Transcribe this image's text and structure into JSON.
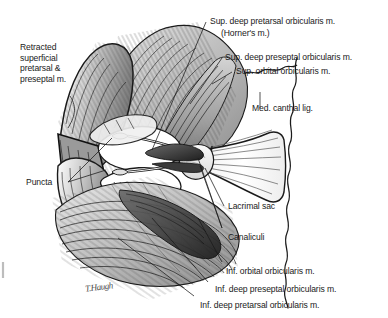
{
  "figure": {
    "signature": "T.Haugh",
    "background_color": "#ffffff",
    "ink_color": "#1a1a1a"
  },
  "labels": {
    "retracted": "Retracted\nsuperficial\npretarsal &\npreseptal m.",
    "retracted_line1": "Retracted",
    "retracted_line2": "superficial",
    "retracted_line3": "pretarsal &",
    "retracted_line4": "preseptal m.",
    "puncta": "Puncta",
    "sup_deep_pretarsal": "Sup. deep pretarsal orbicularis m.",
    "horners": "(Horner's m.)",
    "sup_deep_preseptal": "Sup. deep preseptal orbicularis m.",
    "sup_orbital": "Sup. orbital orbicularis m.",
    "med_canthal": "Med. canthal lig.",
    "lacrimal_sac": "Lacrimal sac",
    "canaliculi": "Canaliculi",
    "inf_orbital": "Inf. orbital orbicularis m.",
    "inf_deep_preseptal": "Inf. deep preseptal orbicularis m.",
    "inf_deep_pretarsal": "Inf. deep pretarsal orbicularis m."
  }
}
